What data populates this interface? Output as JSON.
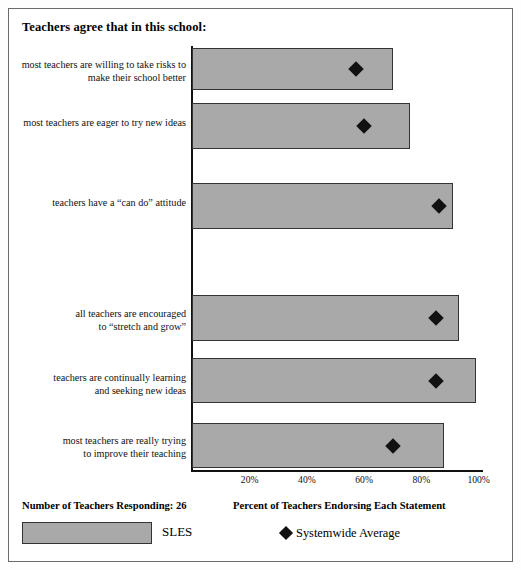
{
  "chart_data": {
    "type": "bar",
    "orientation": "horizontal",
    "title": "Teachers agree that in this school:",
    "xlabel": "Percent of Teachers Endorsing Each Statement",
    "ylabel": "",
    "xlim": [
      0,
      110
    ],
    "grid": false,
    "tick_labels": [
      "20%",
      "40%",
      "60%",
      "80%",
      "100%"
    ],
    "tick_values": [
      20,
      40,
      60,
      80,
      100
    ],
    "categories": [
      "most teachers are willing to take risks to make their school better",
      "most teachers are eager to try new ideas",
      "teachers have a \"can do\" attitude",
      "all teachers are encouraged to \"stretch and grow\"",
      "teachers are continually learning and seeking new ideas",
      "most teachers are really trying to improve their teaching"
    ],
    "category_lines": [
      [
        "most teachers are willing to take risks to",
        "make their school better"
      ],
      [
        "most teachers are eager to try new ideas"
      ],
      [
        "teachers have a “can do” attitude"
      ],
      [
        "all teachers are encouraged",
        "to “stretch and grow”"
      ],
      [
        "teachers are continually learning",
        "and seeking new ideas"
      ],
      [
        "most teachers are really trying",
        "to improve their teaching"
      ]
    ],
    "series": [
      {
        "name": "SLES",
        "type": "bar",
        "values": [
          70,
          76,
          91,
          93,
          99,
          88
        ]
      },
      {
        "name": "Systemwide Average",
        "type": "marker",
        "values": [
          57,
          60,
          86,
          85,
          85,
          70
        ]
      }
    ],
    "legend_position": "bottom"
  },
  "footer": {
    "respondents_label": "Number of Teachers Responding: 26",
    "axis_title": "Percent of Teachers Endorsing Each Statement",
    "bar_legend_label": "SLES",
    "marker_legend_label": "Systemwide Average"
  }
}
